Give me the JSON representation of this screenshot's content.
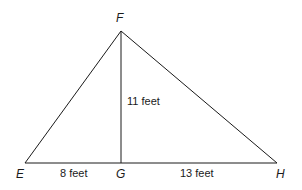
{
  "diagram": {
    "type": "triangle",
    "vertices": {
      "F": {
        "label": "F"
      },
      "E": {
        "label": "E"
      },
      "G": {
        "label": "G"
      },
      "H": {
        "label": "H"
      }
    },
    "measurements": {
      "FG": "11 feet",
      "EG": "8 feet",
      "GH": "13 feet"
    },
    "line_color": "#1a1a1a"
  }
}
